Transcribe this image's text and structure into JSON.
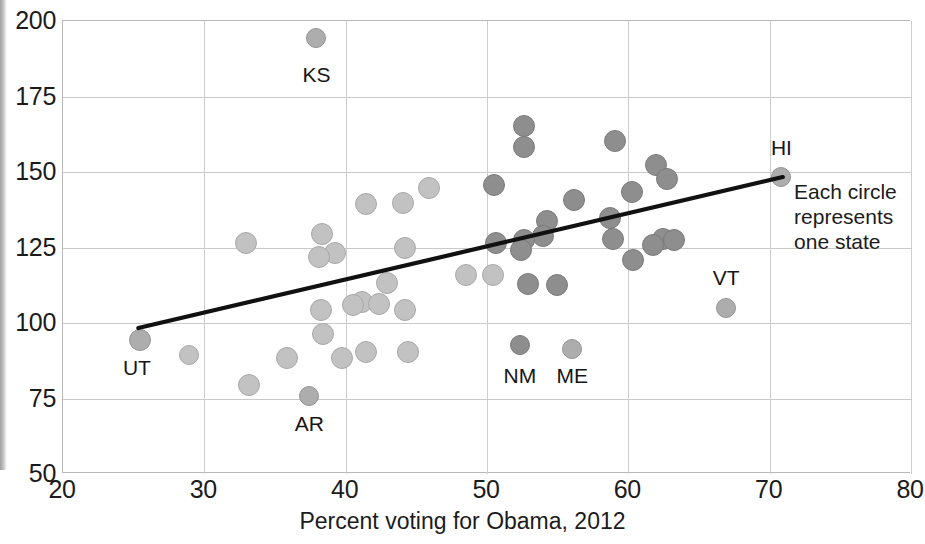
{
  "chart_data": {
    "type": "scatter",
    "title": "",
    "xlabel": "Percent voting for Obama, 2012",
    "ylabel": "",
    "xlim": [
      20,
      80
    ],
    "ylim": [
      50,
      200
    ],
    "xticks": [
      20,
      30,
      40,
      50,
      60,
      70,
      80
    ],
    "yticks": [
      50,
      75,
      100,
      125,
      150,
      175,
      200
    ],
    "grid": true,
    "legend": "none",
    "annotations": [
      {
        "name": "each-circle-note",
        "text": "Each circle\nrepresents\none state",
        "x": 71.8,
        "y": 143
      }
    ],
    "trendline": {
      "type": "linear",
      "x0": 25.4,
      "y0": 98.0,
      "x1": 71.0,
      "y1": 148.0,
      "color": "#111111",
      "width": 4.2
    },
    "point_labels": [
      {
        "label": "KS",
        "x": 38.0,
        "y": 182.0
      },
      {
        "label": "HI",
        "x": 70.9,
        "y": 158.0
      },
      {
        "label": "VT",
        "x": 67.0,
        "y": 115.0
      },
      {
        "label": "UT",
        "x": 25.3,
        "y": 85.0
      },
      {
        "label": "AR",
        "x": 37.5,
        "y": 66.5
      },
      {
        "label": "NM",
        "x": 52.4,
        "y": 82.5
      },
      {
        "label": "ME",
        "x": 56.1,
        "y": 82.5
      }
    ],
    "points": [
      {
        "state": "KS",
        "x": 38.0,
        "y": 194.0,
        "tone": "mid",
        "r": 10
      },
      {
        "state": "",
        "x": 52.7,
        "y": 165.0,
        "tone": "dark",
        "r": 11
      },
      {
        "state": "",
        "x": 59.1,
        "y": 160.0,
        "tone": "dark",
        "r": 11
      },
      {
        "state": "",
        "x": 52.7,
        "y": 158.0,
        "tone": "dark",
        "r": 11
      },
      {
        "state": "",
        "x": 62.0,
        "y": 152.0,
        "tone": "dark",
        "r": 11
      },
      {
        "state": "HI",
        "x": 70.9,
        "y": 148.0,
        "tone": "mid",
        "r": 10
      },
      {
        "state": "",
        "x": 62.8,
        "y": 147.5,
        "tone": "dark",
        "r": 11
      },
      {
        "state": "",
        "x": 50.6,
        "y": 145.5,
        "tone": "dark",
        "r": 11
      },
      {
        "state": "",
        "x": 46.0,
        "y": 144.5,
        "tone": "light",
        "r": 11
      },
      {
        "state": "",
        "x": 60.3,
        "y": 143.0,
        "tone": "dark",
        "r": 11
      },
      {
        "state": "",
        "x": 56.2,
        "y": 140.5,
        "tone": "dark",
        "r": 11
      },
      {
        "state": "",
        "x": 44.1,
        "y": 139.5,
        "tone": "light",
        "r": 11
      },
      {
        "state": "",
        "x": 41.5,
        "y": 139.0,
        "tone": "light",
        "r": 11
      },
      {
        "state": "",
        "x": 58.8,
        "y": 134.5,
        "tone": "dark",
        "r": 11
      },
      {
        "state": "",
        "x": 54.3,
        "y": 133.5,
        "tone": "dark",
        "r": 11
      },
      {
        "state": "",
        "x": 38.4,
        "y": 129.0,
        "tone": "light",
        "r": 11
      },
      {
        "state": "",
        "x": 54.0,
        "y": 128.5,
        "tone": "dark",
        "r": 11
      },
      {
        "state": "",
        "x": 59.0,
        "y": 127.5,
        "tone": "dark",
        "r": 11
      },
      {
        "state": "",
        "x": 62.5,
        "y": 127.5,
        "tone": "dark",
        "r": 11
      },
      {
        "state": "",
        "x": 63.3,
        "y": 127.0,
        "tone": "dark",
        "r": 11
      },
      {
        "state": "",
        "x": 52.7,
        "y": 127.0,
        "tone": "dark",
        "r": 11
      },
      {
        "state": "",
        "x": 50.7,
        "y": 126.0,
        "tone": "dark",
        "r": 11
      },
      {
        "state": "",
        "x": 33.0,
        "y": 126.0,
        "tone": "light",
        "r": 11
      },
      {
        "state": "",
        "x": 61.8,
        "y": 125.5,
        "tone": "dark",
        "r": 11
      },
      {
        "state": "",
        "x": 44.3,
        "y": 124.5,
        "tone": "light",
        "r": 11
      },
      {
        "state": "",
        "x": 52.5,
        "y": 124.0,
        "tone": "dark",
        "r": 11
      },
      {
        "state": "",
        "x": 39.3,
        "y": 123.0,
        "tone": "light",
        "r": 11
      },
      {
        "state": "",
        "x": 38.2,
        "y": 121.5,
        "tone": "light",
        "r": 11
      },
      {
        "state": "",
        "x": 60.4,
        "y": 120.5,
        "tone": "dark",
        "r": 11
      },
      {
        "state": "",
        "x": 50.5,
        "y": 115.5,
        "tone": "light",
        "r": 11
      },
      {
        "state": "",
        "x": 48.6,
        "y": 115.5,
        "tone": "light",
        "r": 11
      },
      {
        "state": "",
        "x": 43.0,
        "y": 113.0,
        "tone": "light",
        "r": 11
      },
      {
        "state": "",
        "x": 53.0,
        "y": 112.5,
        "tone": "dark",
        "r": 11
      },
      {
        "state": "",
        "x": 55.0,
        "y": 112.3,
        "tone": "dark",
        "r": 11
      },
      {
        "state": "",
        "x": 41.2,
        "y": 106.5,
        "tone": "light",
        "r": 11
      },
      {
        "state": "",
        "x": 42.4,
        "y": 106.0,
        "tone": "light",
        "r": 11
      },
      {
        "state": "",
        "x": 40.6,
        "y": 105.5,
        "tone": "light",
        "r": 11
      },
      {
        "state": "VT",
        "x": 67.0,
        "y": 104.5,
        "tone": "mid",
        "r": 10
      },
      {
        "state": "",
        "x": 44.3,
        "y": 104.0,
        "tone": "light",
        "r": 11
      },
      {
        "state": "",
        "x": 38.3,
        "y": 104.0,
        "tone": "light",
        "r": 11
      },
      {
        "state": "",
        "x": 38.5,
        "y": 96.0,
        "tone": "light",
        "r": 11
      },
      {
        "state": "UT",
        "x": 25.5,
        "y": 94.0,
        "tone": "mid",
        "r": 11
      },
      {
        "state": "NM",
        "x": 52.4,
        "y": 92.5,
        "tone": "dark",
        "r": 10
      },
      {
        "state": "ME",
        "x": 56.1,
        "y": 91.0,
        "tone": "mid",
        "r": 10
      },
      {
        "state": "",
        "x": 41.5,
        "y": 90.0,
        "tone": "light",
        "r": 11
      },
      {
        "state": "",
        "x": 44.5,
        "y": 90.0,
        "tone": "light",
        "r": 11
      },
      {
        "state": "",
        "x": 29.0,
        "y": 89.0,
        "tone": "light",
        "r": 10
      },
      {
        "state": "",
        "x": 35.9,
        "y": 88.0,
        "tone": "light",
        "r": 11
      },
      {
        "state": "",
        "x": 39.8,
        "y": 88.0,
        "tone": "light",
        "r": 11
      },
      {
        "state": "",
        "x": 33.2,
        "y": 79.0,
        "tone": "light",
        "r": 11
      },
      {
        "state": "AR",
        "x": 37.5,
        "y": 75.5,
        "tone": "mid",
        "r": 10
      }
    ]
  }
}
